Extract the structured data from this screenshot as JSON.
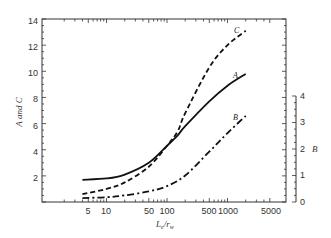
{
  "chart_data": {
    "type": "line",
    "title": "",
    "xlabel": "L_e/r_w",
    "ylabel": "A and C",
    "y2label": "B",
    "xscale": "log",
    "xlim": [
      1,
      5000
    ],
    "ylim": [
      0,
      14
    ],
    "y2lim": [
      0,
      4
    ],
    "xticks": [
      5,
      10,
      50,
      100,
      500,
      1000,
      5000
    ],
    "yticks": [
      2,
      4,
      6,
      8,
      10,
      12,
      14
    ],
    "y2ticks": [
      0,
      1,
      2,
      3,
      4
    ],
    "grid": false,
    "legend": "inline labels",
    "series": [
      {
        "name": "A",
        "axis": "left",
        "style": "solid",
        "x": [
          4,
          10,
          20,
          50,
          100,
          150,
          200,
          500,
          1000,
          2000
        ],
        "y": [
          1.7,
          1.8,
          2.1,
          3.0,
          4.3,
          5.1,
          5.8,
          7.7,
          8.9,
          9.8
        ]
      },
      {
        "name": "C",
        "axis": "left",
        "style": "dashed",
        "x": [
          4,
          10,
          20,
          50,
          100,
          150,
          200,
          500,
          1000,
          2000
        ],
        "y": [
          0.6,
          1.0,
          1.5,
          2.7,
          4.3,
          5.4,
          6.8,
          10.3,
          12.0,
          13.1
        ]
      },
      {
        "name": "B",
        "axis": "right",
        "style": "dash-dot",
        "x": [
          4,
          10,
          20,
          50,
          100,
          200,
          500,
          1000,
          2000
        ],
        "y": [
          0.15,
          0.18,
          0.25,
          0.4,
          0.6,
          1.0,
          1.9,
          2.6,
          3.25
        ]
      }
    ]
  },
  "labels": {
    "xlabel": "L",
    "xlabel_sub_e": "e",
    "xlabel_slash": "/",
    "xlabel_r": "r",
    "xlabel_sub_w": "w",
    "ylabel": "A and C",
    "y2label": "B",
    "curve_A": "A",
    "curve_B": "B",
    "curve_C": "C",
    "xtick_5": "5",
    "xtick_10": "10",
    "xtick_50": "50",
    "xtick_100": "100",
    "xtick_500": "500",
    "xtick_1000": "1000",
    "xtick_5000": "5000",
    "ytick_2": "2",
    "ytick_4": "4",
    "ytick_6": "6",
    "ytick_8": "8",
    "ytick_10": "10",
    "ytick_12": "12",
    "ytick_14": "14",
    "y2tick_0": "0",
    "y2tick_1": "1",
    "y2tick_2": "2",
    "y2tick_3": "3",
    "y2tick_4": "4"
  }
}
